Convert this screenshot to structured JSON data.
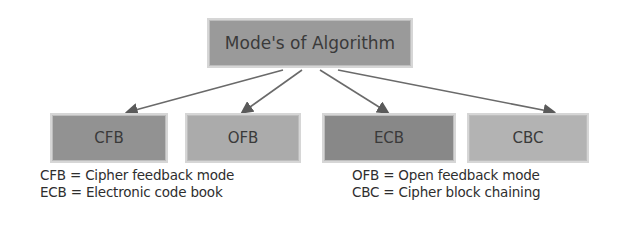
{
  "diagram": {
    "root": {
      "label": "Mode's of Algorithm",
      "color": "#9a9a9a"
    },
    "modes": [
      {
        "label": "CFB",
        "color": "#929292"
      },
      {
        "label": "OFB",
        "color": "#ababab"
      },
      {
        "label": "ECB",
        "color": "#888888"
      },
      {
        "label": "CBC",
        "color": "#b3b3b3"
      }
    ],
    "arrow_color": "#5a5a5a"
  },
  "legend": {
    "left": [
      "CFB = Cipher feedback mode",
      "ECB = Electronic code book"
    ],
    "right": [
      "OFB = Open feedback mode",
      "CBC = Cipher block chaining"
    ]
  }
}
